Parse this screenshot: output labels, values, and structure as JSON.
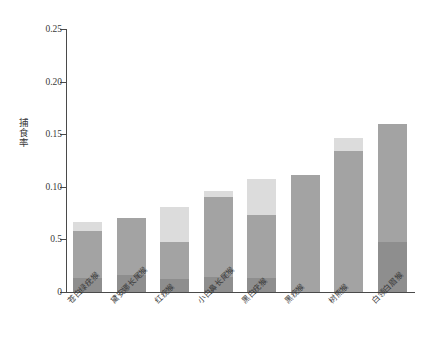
{
  "chart_data": {
    "type": "bar",
    "stacked": true,
    "title": "",
    "xlabel": "",
    "ylabel": "捕食率",
    "ylim": [
      0,
      0.25
    ],
    "ytick_labels": [
      "0.25",
      "0.20",
      "0.15",
      "0.10",
      "0.5",
      "0"
    ],
    "ytick_values": [
      0.25,
      0.2,
      0.15,
      0.1,
      0.05,
      0
    ],
    "grid": false,
    "legend": "none",
    "categories": [
      "苍白绿疣猴",
      "黛安娜长尾猴",
      "红疣猴",
      "小白鼻长尾猴",
      "黑白疣猴",
      "黑疣猴",
      "树熊猴",
      "白领白眉猴"
    ],
    "series": [
      {
        "name": "底层",
        "color": "#8e8e8e",
        "values": [
          0.013,
          0.016,
          0.012,
          0.014,
          0.013,
          0.0,
          0.0,
          0.048
        ]
      },
      {
        "name": "中层",
        "color": "#a3a3a3",
        "values": [
          0.045,
          0.054,
          0.036,
          0.076,
          0.06,
          0.111,
          0.134,
          0.112
        ]
      },
      {
        "name": "上层",
        "color": "#dcdcdc",
        "values": [
          0.009,
          0.0,
          0.033,
          0.006,
          0.034,
          0.0,
          0.012,
          0.0
        ]
      }
    ],
    "totals": [
      0.067,
      0.07,
      0.081,
      0.096,
      0.107,
      0.111,
      0.146,
      0.16
    ]
  },
  "colors": {
    "axis": "#4a4a4a",
    "text": "#3a3a3a",
    "background": "#ffffff",
    "segment_bottom": "#8e8e8e",
    "segment_middle": "#a3a3a3",
    "segment_top": "#dcdcdc"
  }
}
